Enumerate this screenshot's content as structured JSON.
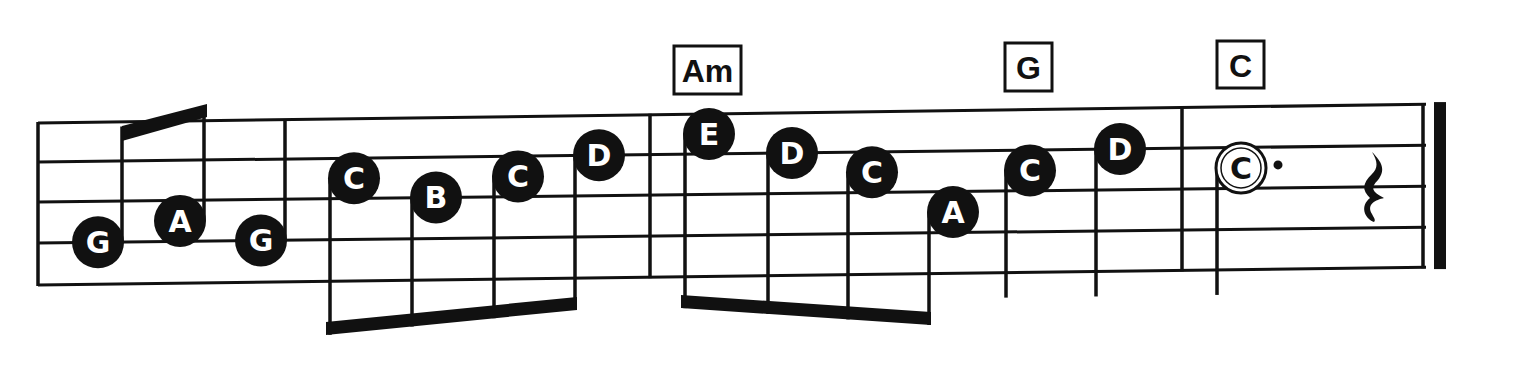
{
  "colors": {
    "ink": "#111111",
    "paper": "#ffffff"
  },
  "chords": [
    {
      "label": "Am",
      "beat_ref": "measure-3-start"
    },
    {
      "label": "G",
      "beat_ref": "measure-3-beat-3"
    },
    {
      "label": "C",
      "beat_ref": "measure-4-start"
    }
  ],
  "measures": [
    {
      "number": 1,
      "notes": [
        {
          "letter": "G",
          "duration": "eighth",
          "filled": true,
          "staff_pos": "line-4",
          "beam_group": 1
        },
        {
          "letter": "A",
          "duration": "eighth",
          "filled": true,
          "staff_pos": "space-3",
          "beam_group": 1
        },
        {
          "letter": "G",
          "duration": "quarter",
          "filled": true,
          "staff_pos": "line-4"
        }
      ]
    },
    {
      "number": 2,
      "notes": [
        {
          "letter": "C",
          "duration": "eighth",
          "filled": true,
          "staff_pos": "space-2",
          "beam_group": 2
        },
        {
          "letter": "B",
          "duration": "eighth",
          "filled": true,
          "staff_pos": "line-3",
          "beam_group": 2
        },
        {
          "letter": "C",
          "duration": "eighth",
          "filled": true,
          "staff_pos": "space-2",
          "beam_group": 2
        },
        {
          "letter": "D",
          "duration": "eighth",
          "filled": true,
          "staff_pos": "line-2",
          "beam_group": 2
        }
      ]
    },
    {
      "number": 3,
      "notes": [
        {
          "letter": "E",
          "duration": "eighth",
          "filled": true,
          "staff_pos": "space-1",
          "beam_group": 3
        },
        {
          "letter": "D",
          "duration": "eighth",
          "filled": true,
          "staff_pos": "line-2",
          "beam_group": 3
        },
        {
          "letter": "C",
          "duration": "eighth",
          "filled": true,
          "staff_pos": "space-2",
          "beam_group": 3
        },
        {
          "letter": "A",
          "duration": "eighth",
          "filled": true,
          "staff_pos": "space-3",
          "beam_group": 3
        },
        {
          "letter": "C",
          "duration": "quarter",
          "filled": true,
          "staff_pos": "space-2"
        },
        {
          "letter": "D",
          "duration": "quarter",
          "filled": true,
          "staff_pos": "line-2"
        }
      ]
    },
    {
      "number": 4,
      "notes": [
        {
          "letter": "C",
          "duration": "dotted-half",
          "filled": false,
          "staff_pos": "space-2",
          "dotted": true
        }
      ],
      "rest": {
        "type": "quarter-rest"
      }
    }
  ],
  "ending": "final-barline"
}
